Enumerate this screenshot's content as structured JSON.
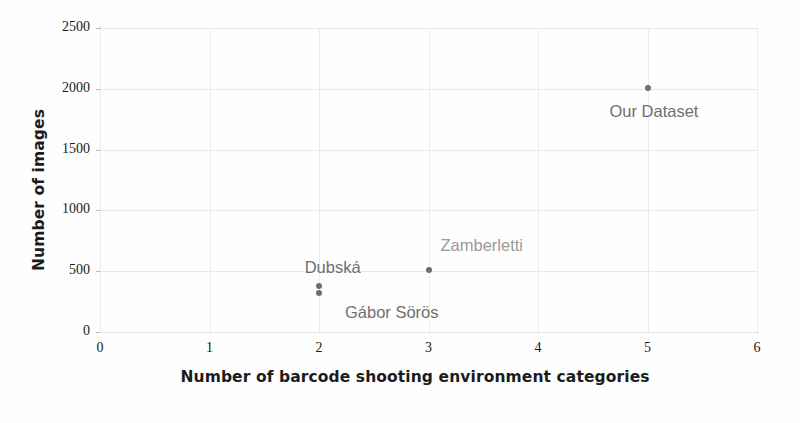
{
  "chart_data": {
    "type": "scatter",
    "title": "",
    "xlabel": "Number of barcode shooting environment categories",
    "ylabel": "Number of images",
    "xlim": [
      0,
      6
    ],
    "ylim": [
      0,
      2500
    ],
    "xticks": [
      "0",
      "1",
      "2",
      "3",
      "4",
      "5",
      "6"
    ],
    "yticks": [
      "0",
      "500",
      "1000",
      "1500",
      "2000",
      "2500"
    ],
    "grid": true,
    "legend": "none",
    "marker_color": "#6e6e6e",
    "points": [
      {
        "label": "Dubská",
        "x": 2,
        "y": 380,
        "label_color": "#6f6f6f",
        "label_dx": -118,
        "label_dy": -40,
        "show_label": false
      },
      {
        "label": "Gábor Sörös",
        "x": 2,
        "y": 320,
        "label_color": "#6f6f6f",
        "label_dx": 26,
        "label_dy": 10,
        "show_label": true
      },
      {
        "label": "Zamberletti",
        "x": 3,
        "y": 510,
        "label_color": "#9a9a9a",
        "label_dx": 12,
        "label_dy": -34,
        "show_label": true
      },
      {
        "label": "Our Dataset",
        "x": 5,
        "y": 2010,
        "label_color": "#6f6f6f",
        "label_dx": -38,
        "label_dy": 14,
        "show_label": true
      }
    ],
    "extra_labels": [
      {
        "text": "Dubská",
        "x": 2.38,
        "y": 520,
        "color": "#6f6f6f",
        "anchor": "end"
      }
    ]
  },
  "annotations": {
    "dubska": "Dubská",
    "zamberletti": "Zamberletti",
    "gabor_soros": "Gábor Sörös",
    "our_dataset": "Our Dataset"
  }
}
